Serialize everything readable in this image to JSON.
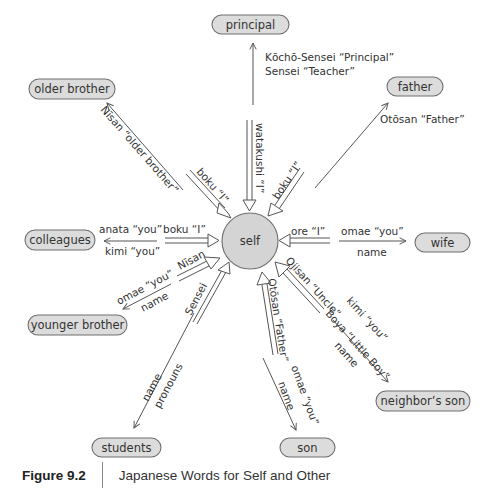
{
  "diagram": {
    "center": {
      "label": "self"
    },
    "nodes": {
      "principal": "principal",
      "older_brother": "older brother",
      "father": "father",
      "colleagues": "colleagues",
      "wife": "wife",
      "younger_brother": "younger brother",
      "neighbors_son": "neighbor’s son",
      "students": "students",
      "son": "son"
    },
    "edges": {
      "principal": {
        "to_other_1": "Kōchō-Sensei “Principal”",
        "to_other_2": "Sensei “Teacher”",
        "to_self": "watakushi “I”"
      },
      "older_brother": {
        "to_other": "Nīsan “older brother”",
        "to_self": "boku “I”"
      },
      "father": {
        "to_other": "Otōsan “Father”",
        "to_self": "boku “I”"
      },
      "colleagues": {
        "to_other_1": "anata “you”",
        "to_other_2": "kimi “you”",
        "to_self": "boku “I”"
      },
      "wife": {
        "to_self": "ore “I”",
        "to_other_1": "omae “you”",
        "to_other_2": "name"
      },
      "younger_brother": {
        "to_other_1": "omae “you”",
        "to_other_2": "name",
        "to_self": "Nīsan"
      },
      "students": {
        "to_self": "Sensei",
        "to_other_1": "name",
        "to_other_2": "pronouns"
      },
      "son": {
        "to_self": "Otōsan “Father”",
        "to_other_1": "omae “you”",
        "to_other_2": "name"
      },
      "neighbors_son": {
        "to_self": "Ojisan “Uncle”",
        "to_other_1": "kimi “you”",
        "to_other_2": "Boya “Little Boy”",
        "to_other_3": "name"
      }
    }
  },
  "caption": {
    "figure_number": "Figure 9.2",
    "title": "Japanese Words for Self and Other"
  }
}
